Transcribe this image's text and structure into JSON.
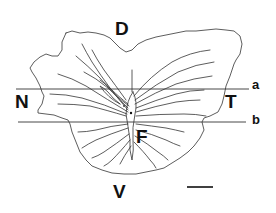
{
  "figure": {
    "type": "retinal flat-mount diagram",
    "colors": {
      "stroke": "#333333",
      "text": "#111111",
      "background": "#ffffff"
    },
    "orientation_labels": {
      "dorsal": "D",
      "ventral": "V",
      "nasal": "N",
      "temporal": "T",
      "fovea": "F"
    },
    "section_lines": [
      {
        "label": "a",
        "y": 89
      },
      {
        "label": "b",
        "y": 122
      }
    ],
    "scale_bar": {
      "label": ""
    }
  }
}
